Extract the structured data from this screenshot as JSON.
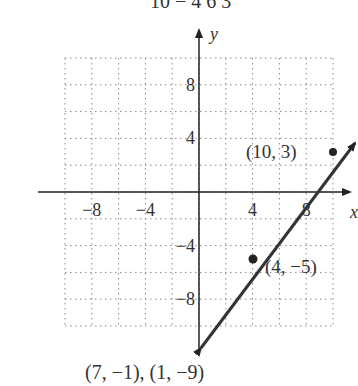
{
  "header_fragment": "10 − 4      6     3",
  "chart_data": {
    "type": "line",
    "title": "",
    "xlabel": "x",
    "ylabel": "y",
    "xlim": [
      -10,
      10
    ],
    "ylim": [
      -10,
      10
    ],
    "grid": true,
    "grid_step": 2,
    "x_ticks": [
      "-8",
      "-4",
      "4",
      "8"
    ],
    "y_ticks": [
      "8",
      "4",
      "-4",
      "-8"
    ],
    "series": [
      {
        "name": "line",
        "slope": 1.333,
        "points": [
          {
            "x": 4,
            "y": -5
          },
          {
            "x": 10,
            "y": 3
          }
        ]
      }
    ],
    "annotations": [
      {
        "label": "(10, 3)",
        "x": 10,
        "y": 3
      },
      {
        "label": "(4, −5)",
        "x": 4,
        "y": -5
      }
    ]
  },
  "caption": "(7, −1), (1, −9)"
}
